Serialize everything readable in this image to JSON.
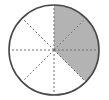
{
  "diagram": {
    "type": "fraction-circle",
    "total_parts": 8,
    "shaded_parts": 3,
    "fraction_shaded": "3/8",
    "shaded_sectors": [
      0,
      1,
      2
    ],
    "colors": {
      "shade": "#b3b3b3",
      "outline": "#4a4a4a",
      "divider": "#6e6e6e",
      "background": "#ffffff"
    }
  }
}
